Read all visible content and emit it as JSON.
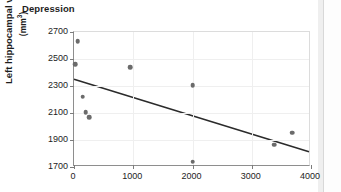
{
  "chart_title": "Depression",
  "axis": {
    "y_label_line1": "Left hippocampal volumne",
    "y_label_line2": "(mm",
    "y_label_sup": "3",
    "y_label_line2_end": ")",
    "y_ticks": [
      2700,
      2500,
      2300,
      2100,
      1900,
      1700
    ],
    "x_ticks": [
      0,
      1000,
      2000,
      3000,
      4000
    ]
  },
  "colors": {
    "marker": "#6b6b6b",
    "trendline": "#2b2b2b",
    "axis": "#8e8e8e",
    "grid": "#efefef",
    "text": "#1d1d1d",
    "background": "#ffffff"
  },
  "chart_data": {
    "type": "scatter",
    "title": "Depression",
    "xlabel": "",
    "ylabel": "Left hippocampal volumne (mm3)",
    "xlim": [
      0,
      4000
    ],
    "ylim": [
      1700,
      2700
    ],
    "xticks": [
      0,
      1000,
      2000,
      3000,
      4000
    ],
    "yticks": [
      1700,
      1900,
      2100,
      2300,
      2500,
      2700
    ],
    "grid": true,
    "legend": null,
    "points": [
      {
        "x": 60,
        "y": 2630
      },
      {
        "x": 25,
        "y": 2460
      },
      {
        "x": 150,
        "y": 2220
      },
      {
        "x": 200,
        "y": 2105
      },
      {
        "x": 260,
        "y": 2070
      },
      {
        "x": 950,
        "y": 2440
      },
      {
        "x": 2000,
        "y": 2305
      },
      {
        "x": 2000,
        "y": 1740
      },
      {
        "x": 3380,
        "y": 1865
      },
      {
        "x": 3680,
        "y": 1955
      }
    ],
    "trendline": {
      "type": "linear",
      "x_start": 0,
      "y_start": 2345,
      "x_end": 4000,
      "y_end": 1800
    }
  }
}
